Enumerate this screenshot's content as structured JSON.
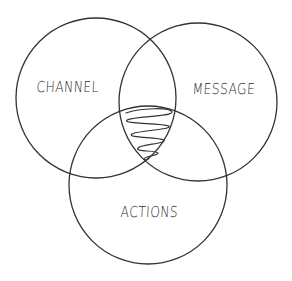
{
  "diagram": {
    "type": "venn",
    "sets": [
      {
        "id": "channel",
        "label": "CHANNEL"
      },
      {
        "id": "message",
        "label": "MESSAGE"
      },
      {
        "id": "actions",
        "label": "ACTIONS"
      }
    ],
    "highlighted_region": {
      "sets": [
        "channel",
        "message",
        "actions"
      ],
      "fill_style": "scribble"
    },
    "colors": {
      "stroke": "#333333",
      "background": "#ffffff"
    }
  }
}
